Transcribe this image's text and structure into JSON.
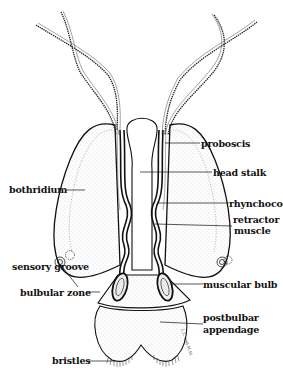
{
  "figure": {
    "labels": {
      "proboscis": "proboscis",
      "head_stalk": "head stalk",
      "rhynchocoel": "rhynchocoel",
      "retractor_muscle_1": "retractor",
      "retractor_muscle_2": "muscle",
      "bothridium": "bothridium",
      "sensory_groove": "sensory groove",
      "bulbular_zone": "bulbular zone",
      "muscular_bulb": "muscular bulb",
      "postbulbar_appendage_1": "postbulbar",
      "postbulbar_appendage_2": "appendage",
      "bristles": "bristles"
    },
    "signature": "L.L. and M.M."
  }
}
